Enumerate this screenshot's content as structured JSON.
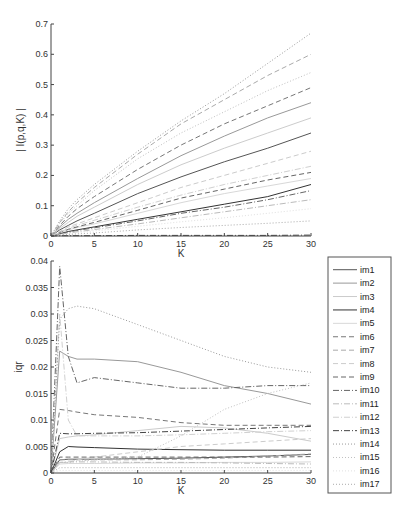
{
  "chart_data": [
    {
      "type": "line",
      "title": "",
      "xlabel": "K",
      "ylabel": "| I(p,q,K) |",
      "xlim": [
        0,
        30
      ],
      "ylim": [
        0,
        0.7
      ],
      "xticks": [
        0,
        5,
        10,
        15,
        20,
        25,
        30
      ],
      "yticks": [
        0,
        0.1,
        0.2,
        0.3,
        0.4,
        0.5,
        0.6,
        0.7
      ],
      "ytick_labels": [
        "0",
        "0.1",
        "0.2",
        "0.3",
        "0.4",
        "0.5",
        "0.6",
        "0.7"
      ],
      "grid": false,
      "x": [
        0,
        1,
        2,
        3,
        5,
        10,
        15,
        20,
        25,
        30
      ],
      "series": [
        {
          "name": "im1",
          "values": [
            0,
            0.02,
            0.035,
            0.05,
            0.075,
            0.14,
            0.195,
            0.245,
            0.29,
            0.34
          ]
        },
        {
          "name": "im2",
          "values": [
            0,
            0.03,
            0.055,
            0.075,
            0.11,
            0.19,
            0.265,
            0.33,
            0.39,
            0.44
          ]
        },
        {
          "name": "im3",
          "values": [
            0,
            0.025,
            0.045,
            0.065,
            0.095,
            0.17,
            0.235,
            0.29,
            0.34,
            0.39
          ]
        },
        {
          "name": "im4",
          "values": [
            0,
            0.008,
            0.015,
            0.02,
            0.03,
            0.055,
            0.08,
            0.105,
            0.13,
            0.17
          ]
        },
        {
          "name": "im5",
          "values": [
            0,
            0.01,
            0.02,
            0.028,
            0.04,
            0.075,
            0.11,
            0.14,
            0.165,
            0.19
          ]
        },
        {
          "name": "im6",
          "values": [
            0,
            0.035,
            0.065,
            0.09,
            0.13,
            0.22,
            0.3,
            0.37,
            0.43,
            0.49
          ]
        },
        {
          "name": "im7",
          "values": [
            0,
            0.045,
            0.08,
            0.11,
            0.16,
            0.27,
            0.37,
            0.45,
            0.53,
            0.6
          ]
        },
        {
          "name": "im8",
          "values": [
            0,
            0.015,
            0.03,
            0.04,
            0.06,
            0.11,
            0.16,
            0.2,
            0.24,
            0.28
          ]
        },
        {
          "name": "im9",
          "values": [
            0,
            0.012,
            0.022,
            0.03,
            0.045,
            0.085,
            0.125,
            0.155,
            0.185,
            0.21
          ]
        },
        {
          "name": "im10",
          "values": [
            0,
            0.007,
            0.013,
            0.018,
            0.027,
            0.05,
            0.075,
            0.095,
            0.12,
            0.15
          ]
        },
        {
          "name": "im11",
          "values": [
            0,
            0.005,
            0.01,
            0.014,
            0.021,
            0.04,
            0.06,
            0.08,
            0.1,
            0.12
          ]
        },
        {
          "name": "im12",
          "values": [
            0,
            0.013,
            0.025,
            0.035,
            0.052,
            0.095,
            0.135,
            0.17,
            0.2,
            0.23
          ]
        },
        {
          "name": "im13",
          "values": [
            0,
            0.001,
            0.001,
            0.001,
            0.001,
            0.002,
            0.002,
            0.002,
            0.002,
            0.003
          ]
        },
        {
          "name": "im14",
          "values": [
            0,
            0.05,
            0.09,
            0.12,
            0.17,
            0.28,
            0.38,
            0.47,
            0.57,
            0.67
          ]
        },
        {
          "name": "im15",
          "values": [
            0,
            0.042,
            0.075,
            0.1,
            0.15,
            0.255,
            0.34,
            0.41,
            0.48,
            0.54
          ]
        },
        {
          "name": "im16",
          "values": [
            0,
            0.004,
            0.008,
            0.011,
            0.017,
            0.032,
            0.047,
            0.06,
            0.075,
            0.09
          ]
        },
        {
          "name": "im17",
          "values": [
            0,
            0.003,
            0.005,
            0.007,
            0.01,
            0.02,
            0.028,
            0.035,
            0.042,
            0.05
          ]
        }
      ]
    },
    {
      "type": "line",
      "title": "",
      "xlabel": "K",
      "ylabel": "iqr",
      "xlim": [
        0,
        30
      ],
      "ylim": [
        0,
        0.04
      ],
      "xticks": [
        0,
        5,
        10,
        15,
        20,
        25,
        30
      ],
      "yticks": [
        0,
        0.005,
        0.01,
        0.015,
        0.02,
        0.025,
        0.03,
        0.035,
        0.04
      ],
      "ytick_labels": [
        "0",
        "0.005",
        "0.01",
        "0.015",
        "0.02",
        "0.025",
        "0.03",
        "0.035",
        "0.04"
      ],
      "grid": false,
      "legend_position": "right outside",
      "x": [
        0,
        1,
        2,
        3,
        5,
        10,
        15,
        20,
        25,
        30
      ],
      "series": [
        {
          "name": "im1",
          "values": [
            0,
            0.0025,
            0.0026,
            0.0026,
            0.0026,
            0.0027,
            0.0028,
            0.003,
            0.0032,
            0.0035
          ]
        },
        {
          "name": "im2",
          "values": [
            0,
            0.023,
            0.022,
            0.0215,
            0.0215,
            0.021,
            0.019,
            0.0165,
            0.015,
            0.013
          ]
        },
        {
          "name": "im3",
          "values": [
            0,
            0.0065,
            0.0068,
            0.007,
            0.0072,
            0.008,
            0.0088,
            0.0085,
            0.0075,
            0.006
          ]
        },
        {
          "name": "im4",
          "values": [
            0,
            0.004,
            0.005,
            0.0049,
            0.0048,
            0.0045,
            0.0044,
            0.0043,
            0.0043,
            0.0043
          ]
        },
        {
          "name": "im5",
          "values": [
            0,
            0.0017,
            0.0018,
            0.0018,
            0.0018,
            0.0019,
            0.0019,
            0.002,
            0.002,
            0.0021
          ]
        },
        {
          "name": "im6",
          "values": [
            0,
            0.012,
            0.0118,
            0.0115,
            0.011,
            0.0105,
            0.0095,
            0.009,
            0.009,
            0.009
          ]
        },
        {
          "name": "im7",
          "values": [
            0,
            0.0025,
            0.0025,
            0.0025,
            0.0025,
            0.0025,
            0.0026,
            0.0028,
            0.0032,
            0.0036
          ]
        },
        {
          "name": "im8",
          "values": [
            0,
            0.002,
            0.002,
            0.0025,
            0.003,
            0.004,
            0.005,
            0.0055,
            0.006,
            0.0065
          ]
        },
        {
          "name": "im9",
          "values": [
            0,
            0.003,
            0.003,
            0.003,
            0.003,
            0.003,
            0.003,
            0.003,
            0.003,
            0.0031
          ]
        },
        {
          "name": "im10",
          "values": [
            0,
            0.039,
            0.022,
            0.017,
            0.018,
            0.017,
            0.016,
            0.016,
            0.0165,
            0.0165
          ]
        },
        {
          "name": "im11",
          "values": [
            0,
            0.002,
            0.0021,
            0.0021,
            0.0021,
            0.002,
            0.002,
            0.0019,
            0.0018,
            0.0017
          ]
        },
        {
          "name": "im12",
          "values": [
            0,
            0.03,
            0.01,
            0.007,
            0.007,
            0.007,
            0.0072,
            0.0075,
            0.0078,
            0.008
          ]
        },
        {
          "name": "im13",
          "values": [
            0,
            0.0075,
            0.0074,
            0.0074,
            0.0075,
            0.0076,
            0.0079,
            0.0082,
            0.0085,
            0.0088
          ]
        },
        {
          "name": "im14",
          "values": [
            0,
            0.029,
            0.031,
            0.0315,
            0.031,
            0.028,
            0.025,
            0.022,
            0.02,
            0.019
          ]
        },
        {
          "name": "im15",
          "values": [
            0,
            0.002,
            0.002,
            0.0022,
            0.0025,
            0.003,
            0.007,
            0.012,
            0.015,
            0.017
          ]
        },
        {
          "name": "im16",
          "values": [
            0,
            0.0005,
            0.0005,
            0.0005,
            0.0005,
            0.0005,
            0.0005,
            0.0005,
            0.0005,
            0.0005
          ]
        },
        {
          "name": "im17",
          "values": [
            0,
            0.001,
            0.001,
            0.001,
            0.001,
            0.001,
            0.001,
            0.001,
            0.001,
            0.001
          ]
        }
      ]
    }
  ],
  "styles": {
    "im1": {
      "color": "#555555",
      "dash": ""
    },
    "im2": {
      "color": "#999999",
      "dash": ""
    },
    "im3": {
      "color": "#cccccc",
      "dash": ""
    },
    "im4": {
      "color": "#333333",
      "dash": ""
    },
    "im5": {
      "color": "#d8d8d8",
      "dash": ""
    },
    "im6": {
      "color": "#777777",
      "dash": "5,3"
    },
    "im7": {
      "color": "#aaaaaa",
      "dash": "5,3"
    },
    "im8": {
      "color": "#cccccc",
      "dash": "5,3"
    },
    "im9": {
      "color": "#666666",
      "dash": "5,3"
    },
    "im10": {
      "color": "#666666",
      "dash": "6,2,1,2"
    },
    "im11": {
      "color": "#bbbbbb",
      "dash": "6,2,1,2"
    },
    "im12": {
      "color": "#d0d0d0",
      "dash": "6,2,1,2"
    },
    "im13": {
      "color": "#444444",
      "dash": "6,2,1,2"
    },
    "im14": {
      "color": "#999999",
      "dash": "1,2"
    },
    "im15": {
      "color": "#c0c0c0",
      "dash": "1,2"
    },
    "im16": {
      "color": "#e0e0e0",
      "dash": "1,2"
    },
    "im17": {
      "color": "#aaaaaa",
      "dash": "1,2"
    }
  },
  "legend": {
    "items": [
      "im1",
      "im2",
      "im3",
      "im4",
      "im5",
      "im6",
      "im7",
      "im8",
      "im9",
      "im10",
      "im11",
      "im12",
      "im13",
      "im14",
      "im15",
      "im16",
      "im17"
    ]
  }
}
